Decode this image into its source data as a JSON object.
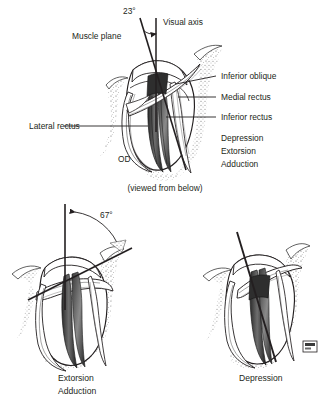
{
  "figure": {
    "title_caption": "(viewed from below)",
    "background": "#ffffff",
    "ink": "#231f20"
  },
  "main_panel": {
    "eye_label": "OD",
    "angle": {
      "value": "23°",
      "between": [
        "Muscle plane",
        "Visual axis"
      ]
    },
    "labels": {
      "muscle_plane": "Muscle plane",
      "visual_axis": "Visual axis",
      "lateral_rectus": "Lateral rectus",
      "inferior_oblique": "Inferior oblique",
      "medial_rectus": "Medial rectus",
      "inferior_rectus": "Inferior rectus"
    },
    "actions": [
      "Depression",
      "Extorsion",
      "Adduction"
    ]
  },
  "bottom_left_panel": {
    "angle": "67°",
    "actions": [
      "Extorsion",
      "Adduction"
    ]
  },
  "bottom_right_panel": {
    "actions": [
      "Depression"
    ],
    "signature": "artist-stamp"
  }
}
